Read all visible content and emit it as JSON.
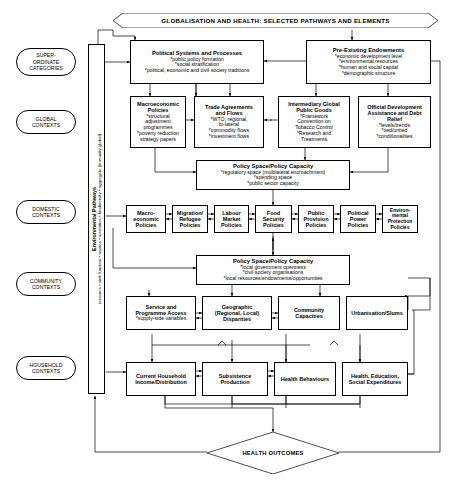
{
  "banner": {
    "text": "GLOBALISATION AND HEALTH: SELECTED PATHWAYS AND ELEMENTS"
  },
  "spine": {
    "title": "Environmental Pathways",
    "subtitle": "resource • sink function • wastes • amenities • biodiversity • aggregate (immunity global)"
  },
  "categories": [
    {
      "id": "super-ordinate",
      "label": "SUPER-\nORDINATE\nCATEGORIES"
    },
    {
      "id": "global",
      "label": "GLOBAL\nCONTEXTS"
    },
    {
      "id": "domestic",
      "label": "DOMESTIC\nCONTEXTS"
    },
    {
      "id": "community",
      "label": "COMMUNITY\nCONTEXTS"
    },
    {
      "id": "household",
      "label": "HOUSEHOLD\nCONTEXTS"
    }
  ],
  "superordinate": [
    {
      "title": "Political Systems and Processes",
      "lines": [
        "*public policy formation",
        "*social stratification",
        "*political, economic and civil society traditions"
      ]
    },
    {
      "title": "Pre-Existing Endowments",
      "lines": [
        "*economic development level",
        "*environmental resources",
        "*human and social capital",
        "*demographic structure"
      ]
    }
  ],
  "global": [
    {
      "title": "Macroeconomic\nPolicies",
      "lines": [
        "*structural adjustment",
        "programmes",
        "*poverty reduction",
        "strategy papers"
      ]
    },
    {
      "title": "Trade Agreements\nand Flows",
      "lines": [
        "*WTO, regional,",
        "bi-lateral",
        "*commodity flows",
        "*investment flows"
      ]
    },
    {
      "title": "Intermediary Global\nPublic Goods",
      "lines": [
        "*Framework",
        "Convention on",
        "Tobacco Control",
        "*Research and",
        "Treatments"
      ]
    },
    {
      "title": "Official Development\nAssistance and Debt\nRelief",
      "lines": [
        "*levels/trends",
        "*tied/untied",
        "*conditionalities"
      ]
    }
  ],
  "policy_space_global": {
    "title": "Policy Space/Policy Capacity",
    "lines": [
      "*regulatory space (multilateral encroachment)",
      "*spending space",
      "*public sector capacity"
    ]
  },
  "domestic": [
    {
      "title": "Macro-\neconomic\nPolicies"
    },
    {
      "title": "Migration/\nRefugee\nPolicies"
    },
    {
      "title": "Labour\nMarket\nPolicies"
    },
    {
      "title": "Food\nSecurity\nPolicies"
    },
    {
      "title": "Public\nProvision\nPolicies"
    },
    {
      "title": "Political\nPower\nPolicies"
    },
    {
      "title": "Environ-\nmental\nProtection\nPolicies"
    }
  ],
  "policy_space_community": {
    "title": "Policy Space/Policy Capacity",
    "lines": [
      "*local government openness",
      "*civil society organisations",
      "*local resources/endowments/opportunities"
    ]
  },
  "community": [
    {
      "title": "Service and\nProgramme Access",
      "lines": [
        "*supply-side variables"
      ]
    },
    {
      "title": "Geographic\n(Regional, Local)\nDisparities",
      "lines": []
    },
    {
      "title": "Community\nCapacities",
      "lines": []
    },
    {
      "title": "Urbanisation/Slums",
      "lines": []
    }
  ],
  "household": [
    {
      "title": "Current Household\nIncome/Distribution"
    },
    {
      "title": "Subsistence\nProduction"
    },
    {
      "title": "Health Behaviours"
    },
    {
      "title": "Health, Education,\nSocial Expenditures"
    }
  ],
  "outcome": {
    "label": "HEALTH OUTCOMES"
  },
  "colors": {
    "line": "#000000",
    "background": "#ffffff"
  }
}
